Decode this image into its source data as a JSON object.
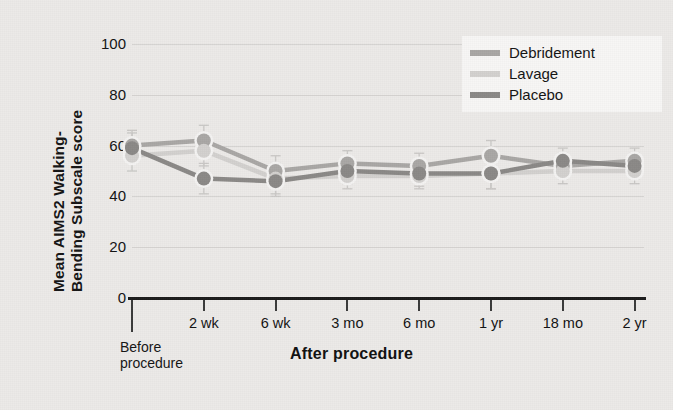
{
  "figure": {
    "background_color": "#eceae8"
  },
  "axes": {
    "y_title_line1": "Mean AIMS2 Walking-",
    "y_title_line2": "Bending Subscale score",
    "y_ticks": [
      "100",
      "80",
      "60",
      "40",
      "20",
      "0"
    ],
    "x_group_label_before": "Before",
    "x_group_label_before2": "procedure",
    "x_group_label_after": "After procedure"
  },
  "legend": {
    "items": [
      {
        "label": "Debridement",
        "color": "#a9a7a5"
      },
      {
        "label": "Lavage",
        "color": "#d2d0ce"
      },
      {
        "label": "Placebo",
        "color": "#8b8987"
      }
    ]
  },
  "chart_data": {
    "type": "line",
    "title": "",
    "xlabel": "After procedure",
    "ylabel": "Mean AIMS2 Walking-Bending Subscale score",
    "ylim": [
      0,
      100
    ],
    "yticks": [
      0,
      20,
      40,
      60,
      80,
      100
    ],
    "grid": true,
    "legend_position": "top-right",
    "categories": [
      "Before procedure",
      "2 wk",
      "6 wk",
      "3 mo",
      "6 mo",
      "1 yr",
      "18 mo",
      "2 yr"
    ],
    "series": [
      {
        "name": "Debridement",
        "color": "#a9a7a5",
        "values": [
          60,
          62,
          50,
          53,
          52,
          56,
          52,
          54
        ],
        "errors": [
          6,
          6,
          6,
          5,
          5,
          6,
          5,
          5
        ]
      },
      {
        "name": "Lavage",
        "color": "#d2d0ce",
        "values": [
          56,
          58,
          47,
          48,
          48,
          49,
          50,
          50
        ],
        "errors": [
          6,
          6,
          6,
          5,
          5,
          6,
          5,
          5
        ]
      },
      {
        "name": "Placebo",
        "color": "#8b8987",
        "values": [
          59,
          47,
          46,
          50,
          49,
          49,
          54,
          52
        ],
        "errors": [
          6,
          6,
          6,
          5,
          5,
          6,
          5,
          5
        ]
      }
    ]
  }
}
